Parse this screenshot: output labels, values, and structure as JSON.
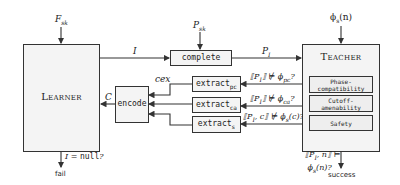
{
  "learner": {
    "title": "Learner",
    "input_label": "F_sk",
    "fail_condition": "I = null?",
    "fail_label": "fail"
  },
  "teacher": {
    "title": "Teacher",
    "input_label": "φ_s(n)",
    "checks": [
      "Phase-compatibility",
      "Cutoff-amenability",
      "Safety"
    ],
    "success_condition_line1": "⟦P_I, n⟧ ⊨",
    "success_condition_line2": "φ_s(n)?",
    "success_label": "success"
  },
  "complete": {
    "label": "complete",
    "input_label": "P_sk",
    "in_edge": "I",
    "out_edge": "P_I"
  },
  "encode": {
    "label": "encode",
    "out_edge": "C",
    "cex_label": "cex"
  },
  "extractors": [
    {
      "name": "extract",
      "sub": "pc",
      "condition": "⟦P_I⟧ ⊭ φ_pc?"
    },
    {
      "name": "extract",
      "sub": "ca",
      "condition": "⟦P_I⟧ ⊭ φ_ca?"
    },
    {
      "name": "extract",
      "sub": "s",
      "condition": "⟦P_I, c⟧ ⊭ φ_s(c)?"
    }
  ],
  "colors": {
    "stroke": "#333333",
    "box_fill": "#f4f4f4",
    "background": "#ffffff"
  }
}
